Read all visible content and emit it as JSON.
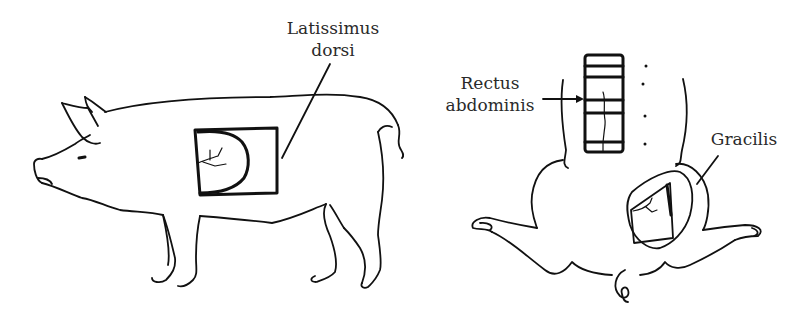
{
  "figure": {
    "panels": [
      {
        "id": "pig-lateral",
        "description": "Lateral view of pig with latissimus dorsi flap outlined",
        "labels": [
          {
            "text_line1": "Latissimus",
            "text_line2": "dorsi"
          }
        ]
      },
      {
        "id": "pig-ventral",
        "description": "Ventral view of pig with rectus abdominis and gracilis flaps outlined",
        "labels": [
          {
            "text_line1": "Rectus",
            "text_line2": "abdominis"
          },
          {
            "text_line1": "Gracilis"
          }
        ]
      }
    ],
    "colors": {
      "line": "#111111",
      "text": "#2a2a2a",
      "background": "#ffffff"
    }
  }
}
